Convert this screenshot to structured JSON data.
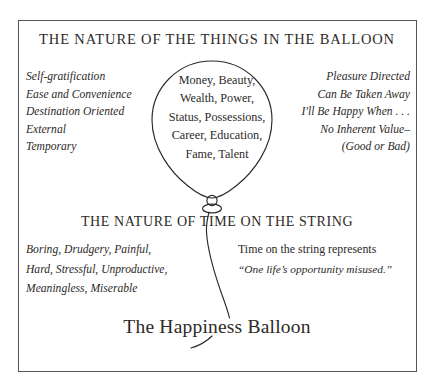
{
  "diagram": {
    "title": "The Happiness Balloon",
    "heading_top": "THE NATURE OF THE THINGS IN THE BALLOON",
    "heading_bottom": "THE NATURE OF TIME ON THE STRING",
    "balloon_contents": [
      "Money, Beauty,",
      "Wealth, Power,",
      "Status, Possessions,",
      "Career, Education,",
      "Fame, Talent"
    ],
    "left_column": [
      "Self-gratification",
      "Ease and Convenience",
      "Destination Oriented",
      "External",
      "Temporary"
    ],
    "right_column": [
      "Pleasure Directed",
      "Can Be Taken Away",
      "I'll Be Happy When . . .",
      "No Inherent Value–",
      "(Good or Bad)"
    ],
    "bottom_left": [
      "Boring, Drudgery, Painful,",
      "Hard, Stressful, Unproductive,",
      "Meaningless, Miserable"
    ],
    "bottom_right": {
      "line1": "Time on the string represents",
      "line2": "“One life’s opportunity misused.”"
    },
    "colors": {
      "ink": "#2d2a28",
      "border": "#53555a",
      "background": "#ffffff"
    }
  }
}
